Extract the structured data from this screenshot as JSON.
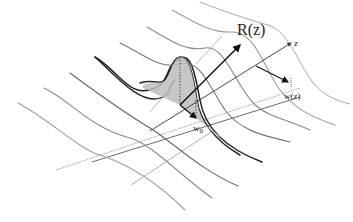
{
  "figure": {
    "labels": {
      "radius_of_curvature": "R(z)",
      "axis": "z",
      "spot_size": "w(z)",
      "waist": "w0",
      "waist_base": "w",
      "waist_sub": "0"
    }
  },
  "colors": {
    "background": "#ffffff",
    "dark_line": "#222222",
    "mid_line": "#555555",
    "light_line": "#9a9a9a",
    "fill": "#bdbdbd"
  }
}
